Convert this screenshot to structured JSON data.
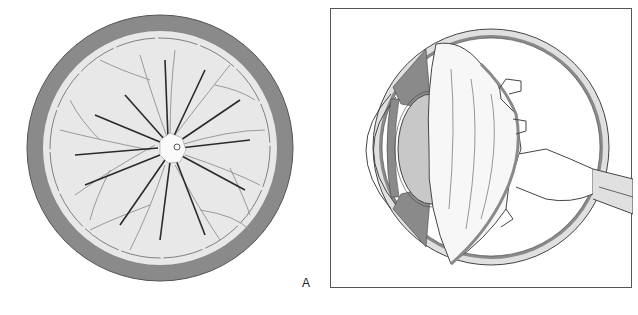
{
  "figure": {
    "panels": [
      {
        "id": "A",
        "label": "A",
        "description": "Fundus view of retina with radiating vessels around optic disc"
      },
      {
        "id": "B",
        "label": "B",
        "description": "Cross-section of eyeball showing lens, vitreous and optic nerve"
      }
    ],
    "colors": {
      "outer_ring": "#8a8a8a",
      "retina_fill": "#e8e8e8",
      "lens_fill": "#c8c8c8",
      "vessel_dark": "#2a2a2a",
      "vessel_light": "#9a9a9a",
      "line": "#444444"
    }
  }
}
